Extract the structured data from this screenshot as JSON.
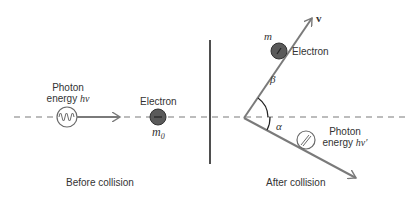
{
  "before": {
    "photon_label_line1": "Photon",
    "photon_label_line2_prefix": "energy ",
    "photon_label_symbol": "hν",
    "electron_label": "Electron",
    "electron_mass": "m",
    "electron_mass_sub": "0",
    "caption": "Before collision"
  },
  "after": {
    "electron_mass": "m",
    "electron_label": "Electron",
    "velocity_label": "v",
    "angle_beta": "β",
    "angle_alpha": "α",
    "photon_label_line1": "Photon",
    "photon_label_line2_prefix": "energy ",
    "photon_label_symbol": "hν′",
    "caption": "After collision"
  },
  "colors": {
    "line": "#7a7a7a",
    "electron_fill": "#5a5a5a",
    "divider": "#222222",
    "text": "#333333"
  }
}
